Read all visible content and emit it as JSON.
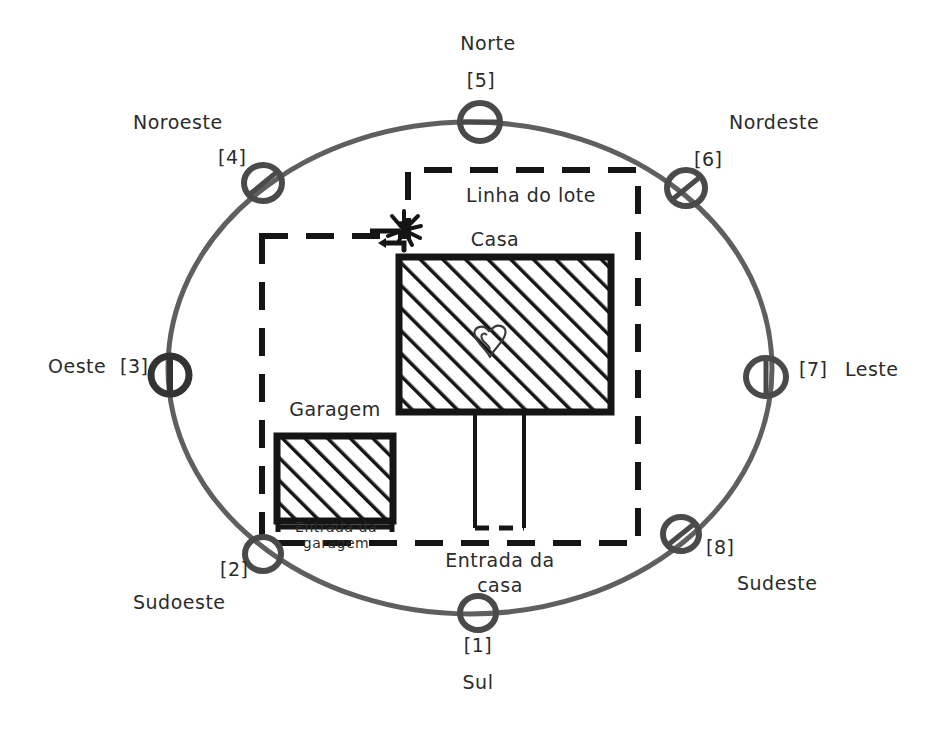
{
  "diagram": {
    "background_color": "#ffffff",
    "ink_color": "#2b2b2b",
    "ellipse_color": "#5a5a5a"
  },
  "compass": {
    "points": [
      {
        "id": 1,
        "label": "Sul",
        "number": "[1]",
        "angle_deg": 270
      },
      {
        "id": 2,
        "label": "Sudoeste",
        "number": "[2]",
        "angle_deg": 225
      },
      {
        "id": 3,
        "label": "Oeste",
        "number": "[3]",
        "angle_deg": 180
      },
      {
        "id": 4,
        "label": "Noroeste",
        "number": "[4]",
        "angle_deg": 135
      },
      {
        "id": 5,
        "label": "Norte",
        "number": "[5]",
        "angle_deg": 90
      },
      {
        "id": 6,
        "label": "Nordeste",
        "number": "[6]",
        "angle_deg": 45
      },
      {
        "id": 7,
        "label": "Leste",
        "number": "[7]",
        "angle_deg": 0
      },
      {
        "id": 8,
        "label": "Sudeste",
        "number": "[8]",
        "angle_deg": 315
      }
    ]
  },
  "plan": {
    "lot_line_label": "Linha do lote",
    "house_label": "Casa",
    "garage_label": "Garagem",
    "garage_entrance_label_line1": "Entrada da",
    "garage_entrance_label_line2": "garagem",
    "house_entrance_label_line1": "Entrada da",
    "house_entrance_label_line2": "casa",
    "symbols": {
      "burst": "burst-symbol",
      "heart": "heart-symbol"
    }
  }
}
